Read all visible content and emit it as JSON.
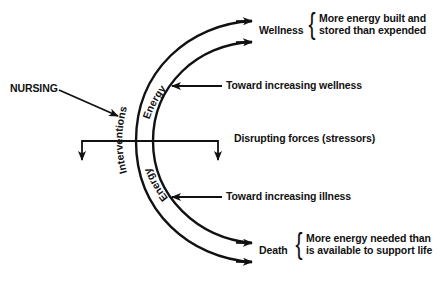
{
  "diagram": {
    "type": "energy-continuum",
    "source_label": "NURSING",
    "arc_labels": {
      "outer": "Interventions",
      "inner_upper": "Energy",
      "inner_lower": "Energy"
    },
    "endpoints": {
      "top": {
        "label": "Wellness",
        "description_line1": "More energy built and",
        "description_line2": "stored than expended"
      },
      "bottom": {
        "label": "Death",
        "description_line1": "More energy needed than",
        "description_line2": "is available to support life"
      }
    },
    "pointers": {
      "toward_wellness": "Toward increasing wellness",
      "disrupting": "Disrupting forces (stressors)",
      "toward_illness": "Toward increasing illness"
    },
    "colors": {
      "ink": "#111111",
      "background": "#ffffff"
    }
  }
}
